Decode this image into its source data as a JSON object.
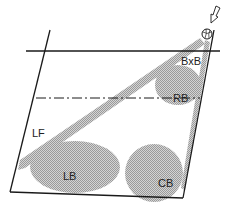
{
  "diagram": {
    "colors": {
      "line": "#1a1a1a",
      "zone_fill": "#bdbdbd",
      "background": "#ffffff"
    },
    "zones": [
      {
        "id": "bxb",
        "label": "BxB"
      },
      {
        "id": "rb",
        "label": "RB"
      },
      {
        "id": "lf",
        "label": "LF"
      },
      {
        "id": "lb",
        "label": "LB"
      },
      {
        "id": "cb",
        "label": "CB"
      }
    ],
    "icons": {
      "ball": "volleyball-icon",
      "arrow": "arrow-down-icon"
    }
  }
}
